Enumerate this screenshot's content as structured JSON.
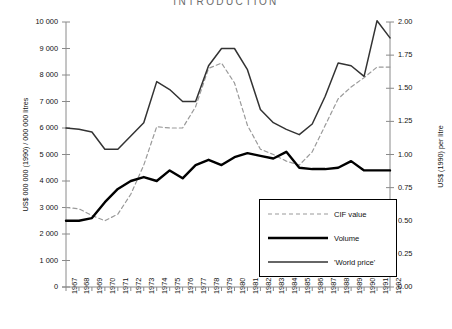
{
  "title": "INTRODUCTION",
  "axes": {
    "left": {
      "label": "US$ 000 000 (1990) / 000 000 litres",
      "ticks": [
        "10 000",
        "9 000",
        "8 000",
        "7 000",
        "6 000",
        "5 000",
        "4 000",
        "3 000",
        "2 000",
        "1 000",
        "0"
      ],
      "min": 0,
      "max": 10000,
      "step": 1000
    },
    "right": {
      "label": "US$ (1990) per litre",
      "ticks": [
        "2.00",
        "1.75",
        "1.50",
        "1.25",
        "1.00",
        "0.75",
        "0.50",
        "0.25",
        "0.00"
      ],
      "min": 0,
      "max": 2.0,
      "step": 0.25
    },
    "x": {
      "ticks": [
        "1967",
        "1968",
        "1969",
        "1970",
        "1971",
        "1972",
        "1973",
        "1974",
        "1975",
        "1976",
        "1977",
        "1978",
        "1979",
        "1980",
        "1981",
        "1982",
        "1983",
        "1984",
        "1985",
        "1986",
        "1987",
        "1988",
        "1989",
        "1990",
        "1991",
        "1992"
      ]
    }
  },
  "legend": {
    "items": [
      {
        "label": "CIF value",
        "style": "dashed",
        "color": "#9a9a9a"
      },
      {
        "label": "Volume",
        "style": "thick-solid",
        "color": "#000000"
      },
      {
        "label": "'World price'",
        "style": "solid",
        "color": "#333333"
      }
    ]
  },
  "chart_data": {
    "type": "line",
    "title": "INTRODUCTION",
    "xlabel": "",
    "ylabel": "US$ 000 000 (1990) / 000 000 litres",
    "y2label": "US$ (1990) per litre",
    "ylim": [
      0,
      10000
    ],
    "y2lim": [
      0,
      2.0
    ],
    "grid": false,
    "legend_position": "inside-bottom-right",
    "x": [
      1967,
      1968,
      1969,
      1970,
      1971,
      1972,
      1973,
      1974,
      1975,
      1976,
      1977,
      1978,
      1979,
      1980,
      1981,
      1982,
      1983,
      1984,
      1985,
      1986,
      1987,
      1988,
      1989,
      1990,
      1991,
      1992
    ],
    "series": [
      {
        "name": "CIF value",
        "axis": "left",
        "style": "dashed",
        "color": "#9a9a9a",
        "values": [
          3000,
          2950,
          2700,
          2500,
          2750,
          3500,
          4600,
          6050,
          6000,
          6000,
          6800,
          8250,
          8450,
          7700,
          6100,
          5200,
          5000,
          4750,
          4600,
          5100,
          6100,
          7100,
          7550,
          7900,
          8300,
          8300
        ]
      },
      {
        "name": "Volume",
        "axis": "left",
        "style": "thick-solid",
        "color": "#000000",
        "values": [
          2500,
          2500,
          2600,
          3200,
          3700,
          4000,
          4150,
          4000,
          4400,
          4100,
          4600,
          4800,
          4600,
          4900,
          5050,
          4950,
          4850,
          5100,
          4500,
          4450,
          4450,
          4500,
          4750,
          4400,
          4400,
          4400
        ]
      },
      {
        "name": "'World price'",
        "axis": "left",
        "style": "solid",
        "color": "#333333",
        "values": [
          6000,
          5950,
          5850,
          5200,
          5200,
          5700,
          6200,
          7750,
          7450,
          7000,
          7000,
          8350,
          9000,
          9000,
          8200,
          6700,
          6200,
          5950,
          5750,
          6150,
          7200,
          8450,
          8350,
          7950,
          10050,
          9400
        ]
      }
    ]
  }
}
